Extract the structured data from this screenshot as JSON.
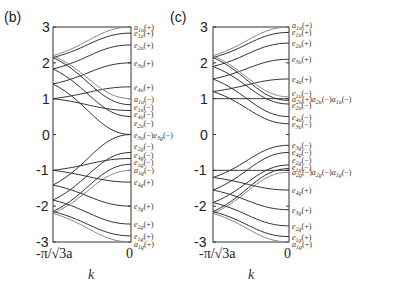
{
  "chart_data": [
    {
      "panel": "(b)",
      "type": "line",
      "title": "",
      "xlabel": "k",
      "ylabel": "",
      "xticks": [
        "-π/√3a",
        "0"
      ],
      "yticks": [
        "3",
        "2",
        "1",
        "0",
        "-1",
        "-2",
        "-3"
      ],
      "ylim": [
        -3,
        3
      ],
      "grid": false,
      "legend_position": "right-edge state labels",
      "series": [
        {
          "name": "a1u(+)",
          "start": 2.2,
          "end": 3.0,
          "light": true
        },
        {
          "name": "e1u(+)",
          "start": 2.15,
          "end": 2.83
        },
        {
          "name": "e2u(+)",
          "start": 1.83,
          "end": 2.5
        },
        {
          "name": "e3u(+)",
          "start": 1.41,
          "end": 2.0
        },
        {
          "name": "e4u(+)",
          "start": 1.0,
          "end": 1.33
        },
        {
          "name": "a1u(-)",
          "start": 2.2,
          "end": 1.0,
          "light": true
        },
        {
          "name": "e1u(-)",
          "start": 2.15,
          "end": 0.83
        },
        {
          "name": "e4u(-)",
          "start": 1.0,
          "end": 0.67
        },
        {
          "name": "e2u(-)",
          "start": 1.83,
          "end": 0.5
        },
        {
          "name": "e3u(-)",
          "start": 1.41,
          "end": 0.0
        },
        {
          "name": "e3g(-)",
          "start": -1.41,
          "end": 0.0
        },
        {
          "name": "e2g(-)",
          "start": -1.83,
          "end": -0.5
        },
        {
          "name": "e4g(-)",
          "start": -1.0,
          "end": -0.67
        },
        {
          "name": "e1g(-)",
          "start": -2.15,
          "end": -0.83
        },
        {
          "name": "a1g(-)",
          "start": -2.2,
          "end": -1.0,
          "light": true
        },
        {
          "name": "e4g(+)",
          "start": -1.0,
          "end": -1.33
        },
        {
          "name": "e3g(+)",
          "start": -1.41,
          "end": -2.0
        },
        {
          "name": "e2g(+)",
          "start": -1.83,
          "end": -2.5
        },
        {
          "name": "e1g(+)",
          "start": -2.15,
          "end": -2.83
        },
        {
          "name": "a1g(+)",
          "start": -2.2,
          "end": -3.0,
          "light": true
        }
      ],
      "labels": [
        {
          "text": "a1u(+)",
          "y": 3.0
        },
        {
          "text": "e1u(+)",
          "y": 2.83
        },
        {
          "text": "e2u(+)",
          "y": 2.5
        },
        {
          "text": "e3u(+)",
          "y": 2.0
        },
        {
          "text": "e4u(+)",
          "y": 1.33
        },
        {
          "text": "a1u(−)",
          "y": 1.0
        },
        {
          "text": "e1u(−)",
          "y": 0.78
        },
        {
          "text": "e4u(−)",
          "y": 0.56
        },
        {
          "text": "e2u(−)",
          "y": 0.32
        },
        {
          "text": "e3u(−)e3g(−)",
          "y": 0.0
        },
        {
          "text": "e2g(−)",
          "y": -0.32
        },
        {
          "text": "e4g(−)",
          "y": -0.56
        },
        {
          "text": "e1g(−)",
          "y": -0.78
        },
        {
          "text": "a1g(−)",
          "y": -1.0
        },
        {
          "text": "e4g(+)",
          "y": -1.33
        },
        {
          "text": "e3g(+)",
          "y": -2.0
        },
        {
          "text": "e2g(+)",
          "y": -2.5
        },
        {
          "text": "e1g(+)",
          "y": -2.83
        },
        {
          "text": "a1g(+)",
          "y": -3.05
        }
      ]
    },
    {
      "panel": "(c)",
      "type": "line",
      "title": "",
      "xlabel": "k",
      "ylabel": "",
      "xticks": [
        "-π/√3a",
        "0"
      ],
      "yticks": [
        "3",
        "2",
        "1",
        "0",
        "-1",
        "-2",
        "-3"
      ],
      "ylim": [
        -3,
        3
      ],
      "grid": false,
      "legend_position": "right-edge state labels",
      "series": [
        {
          "name": "a1u(+)",
          "start": 2.2,
          "end": 3.0,
          "light": true
        },
        {
          "name": "e1u(+)",
          "start": 2.15,
          "end": 2.85
        },
        {
          "name": "e2u(+)",
          "start": 1.9,
          "end": 2.55
        },
        {
          "name": "e3u(+)",
          "start": 1.55,
          "end": 2.1
        },
        {
          "name": "e4u(+)",
          "start": 1.2,
          "end": 1.55
        },
        {
          "name": "a2u(+)",
          "start": 1.0,
          "end": 1.0
        },
        {
          "name": "e1u(-)",
          "start": 2.2,
          "end": 1.05,
          "light": true
        },
        {
          "name": "a1u(-)",
          "start": 2.15,
          "end": 0.95
        },
        {
          "name": "e2u(-)",
          "start": 1.9,
          "end": 0.85
        },
        {
          "name": "e4u(-)",
          "start": 1.55,
          "end": 0.5
        },
        {
          "name": "e3u(-)",
          "start": 1.2,
          "end": 0.3
        },
        {
          "name": "e3g(-)",
          "start": -1.2,
          "end": -0.3
        },
        {
          "name": "e4g(-)",
          "start": -1.55,
          "end": -0.5
        },
        {
          "name": "e2g(-)",
          "start": -1.9,
          "end": -0.85
        },
        {
          "name": "e1g(-)",
          "start": -2.15,
          "end": -0.95
        },
        {
          "name": "a2g(-)",
          "start": -1.0,
          "end": -1.0
        },
        {
          "name": "a1g(-)",
          "start": -2.2,
          "end": -1.05,
          "light": true
        },
        {
          "name": "e4g(+)",
          "start": -1.2,
          "end": -1.55
        },
        {
          "name": "e3g(+)",
          "start": -1.55,
          "end": -2.1
        },
        {
          "name": "e2g(+)",
          "start": -1.9,
          "end": -2.55
        },
        {
          "name": "e1g(+)",
          "start": -2.15,
          "end": -2.85
        },
        {
          "name": "a1g(+)",
          "start": -2.2,
          "end": -3.0,
          "light": true
        }
      ],
      "labels": [
        {
          "text": "a1u(+)",
          "y": 3.05
        },
        {
          "text": "e1u(+)",
          "y": 2.85
        },
        {
          "text": "e2u(+)",
          "y": 2.55
        },
        {
          "text": "e3u(+)",
          "y": 2.1
        },
        {
          "text": "e4u(+)",
          "y": 1.55
        },
        {
          "text": "e1u(−)",
          "y": 1.15
        },
        {
          "text": "a2u(+)a2u(−)a1u(−)",
          "y": 0.98
        },
        {
          "text": "e2u(−)",
          "y": 0.82
        },
        {
          "text": "e4u(−)",
          "y": 0.5
        },
        {
          "text": "e3u(−)",
          "y": 0.28
        },
        {
          "text": "e3g(−)",
          "y": -0.28
        },
        {
          "text": "e4g(−)",
          "y": -0.5
        },
        {
          "text": "e2g(−)",
          "y": -0.72
        },
        {
          "text": "e1g(−)",
          "y": -0.9
        },
        {
          "text": "a2g(−)a2g(−)a1g(−)",
          "y": -1.05
        },
        {
          "text": "e4g(+)",
          "y": -1.55
        },
        {
          "text": "e3g(+)",
          "y": -2.1
        },
        {
          "text": "e2g(+)",
          "y": -2.55
        },
        {
          "text": "e1g(+)",
          "y": -2.85
        },
        {
          "text": "a1g(+)",
          "y": -3.05
        }
      ]
    }
  ],
  "panels": {
    "b": {
      "label": "(b)",
      "xtick_left": "-π/√3a",
      "xtick_right": "0",
      "xlabel": "k"
    },
    "c": {
      "label": "(c)",
      "xtick_left": "-π/√3a",
      "xtick_right": "0",
      "xlabel": "k"
    }
  },
  "yticks": [
    "3",
    "2",
    "1",
    "0",
    "-1",
    "-2",
    "-3"
  ]
}
